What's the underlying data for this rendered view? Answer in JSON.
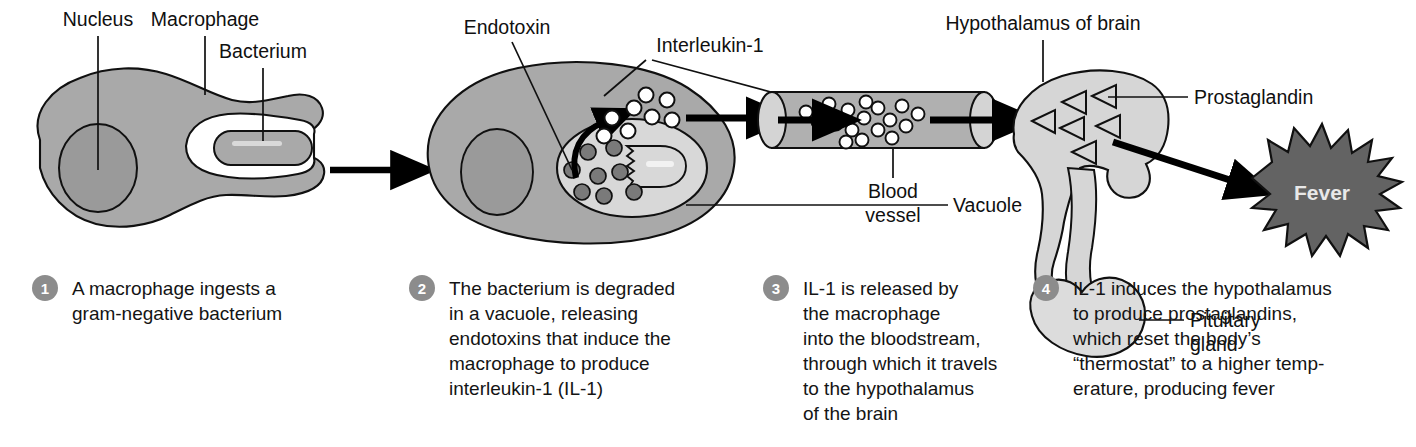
{
  "figure": {
    "panels": 4
  },
  "colors": {
    "cytoplasm": "#a9a9a9",
    "nucleus": "#9a9a9a",
    "vacuole_light": "#d8d8d8",
    "bacterium": "#a9a9a9",
    "vessel": "#b0b0b0",
    "vessel_end": "#d4d4d4",
    "brain": "#d6d6d6",
    "pituitary": "#dcdcdc",
    "fever_burst": "#636363",
    "fever_label": "#e8e8e8",
    "outline": "#101010",
    "arrow": "#000000",
    "number_badge": "#8c8c8c",
    "endotoxin_dot": "#7a7a7a",
    "text": "#141414"
  },
  "labels": [
    {
      "id": "nucleus",
      "text": "Nucleus"
    },
    {
      "id": "macrophage",
      "text": "Macrophage"
    },
    {
      "id": "bacterium",
      "text": "Bacterium"
    },
    {
      "id": "endotoxin",
      "text": "Endotoxin"
    },
    {
      "id": "interleukin1",
      "text": "Interleukin-1"
    },
    {
      "id": "vacuole",
      "text": "Vacuole"
    },
    {
      "id": "blood_vessel_line1",
      "text": "Blood"
    },
    {
      "id": "blood_vessel_line2",
      "text": "vessel"
    },
    {
      "id": "hypothalamus",
      "text": "Hypothalamus of brain"
    },
    {
      "id": "prostaglandin",
      "text": "Prostaglandin"
    },
    {
      "id": "pituitary_line1",
      "text": "Pituitary"
    },
    {
      "id": "pituitary_line2",
      "text": "gland"
    },
    {
      "id": "fever",
      "text": "Fever"
    }
  ],
  "steps": [
    {
      "number": "1",
      "lines": [
        "A macrophage ingests a",
        "gram-negative bacterium"
      ]
    },
    {
      "number": "2",
      "lines": [
        "The bacterium is degraded",
        "in a vacuole, releasing",
        "endotoxins that induce the",
        "macrophage to produce",
        "interleukin-1 (IL-1)"
      ]
    },
    {
      "number": "3",
      "lines": [
        "IL-1 is released by",
        "the macrophage",
        "into the bloodstream,",
        "through which it travels",
        "to the hypothalamus",
        "of the brain"
      ]
    },
    {
      "number": "4",
      "lines": [
        "IL-1 induces the hypothalamus",
        "to produce prostaglandins,",
        "which reset the body’s",
        "“thermostat” to a higher temp-",
        "erature, producing fever"
      ]
    }
  ],
  "graphics": {
    "endotoxin_dot_count": 8,
    "il1_dots_outside_cell": 8,
    "il1_dots_in_vessel": 17,
    "prostaglandin_triangles": 6,
    "arrows": 4,
    "arrow_direction": "left-to-right"
  }
}
